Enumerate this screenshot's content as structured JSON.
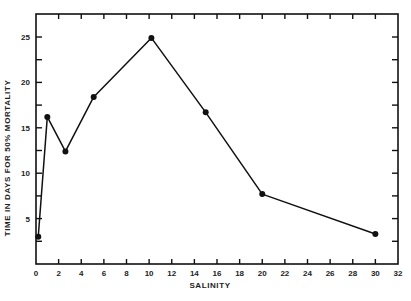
{
  "chart_data": {
    "type": "line",
    "title": "",
    "xlabel": "SALINITY",
    "ylabel": "TIME IN DAYS FOR 50% MORTALITY",
    "xlim": [
      0,
      32
    ],
    "ylim": [
      0,
      27.5
    ],
    "x_ticks": [
      0,
      2,
      4,
      6,
      8,
      10,
      12,
      14,
      16,
      18,
      20,
      22,
      24,
      26,
      28,
      30,
      32
    ],
    "y_ticks": [
      5,
      10,
      15,
      20,
      25
    ],
    "y_minor_ticks": [
      2.5,
      7.5,
      12.5,
      17.5,
      22.5
    ],
    "grid": false,
    "legend": null,
    "series": [
      {
        "name": "50% mortality time",
        "x": [
          0.2,
          1.0,
          2.6,
          5.1,
          10.2,
          15.0,
          20.0,
          30.0
        ],
        "values": [
          3.0,
          16.2,
          12.4,
          18.4,
          24.9,
          16.7,
          7.7,
          3.3
        ],
        "marker": "filled-circle",
        "color": "#111111"
      }
    ]
  },
  "colors": {
    "ink": "#111111",
    "background": "#ffffff"
  }
}
